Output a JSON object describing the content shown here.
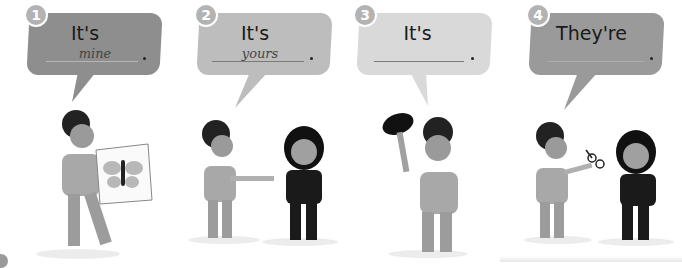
{
  "exercise": {
    "items": [
      {
        "number": "1",
        "phrase": "It's",
        "answer": "mine",
        "end": ".",
        "bubble_color": "#8e8e8e",
        "scene": "boy holding butterfly picture"
      },
      {
        "number": "2",
        "phrase": "It's",
        "answer": "yours",
        "end": ".",
        "bubble_color": "#bdbdbd",
        "scene": "boy handing object to girl"
      },
      {
        "number": "3",
        "phrase": "It's",
        "answer": "",
        "end": ".",
        "bubble_color": "#d9d9d9",
        "scene": "boy holding up cap"
      },
      {
        "number": "4",
        "phrase": "They're",
        "answer": "",
        "end": ".",
        "bubble_color": "#9a9a9a",
        "scene": "boy handing glasses to girl"
      }
    ]
  }
}
